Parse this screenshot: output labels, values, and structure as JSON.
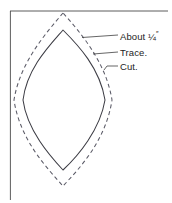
{
  "figure": {
    "name": "sewing-pattern-seam-allowance-diagram",
    "background_color": "#ffffff",
    "frame": {
      "top_rule_color": "#4a4a4a",
      "left_rule_color": "#4a4a4a"
    },
    "shapes": {
      "cut_line": {
        "label": "Cut.",
        "style": "dashed",
        "color": "#5a5a66",
        "dash_pattern": "4 3"
      },
      "trace_line": {
        "label": "Trace.",
        "style": "solid",
        "color": "#3c3c44"
      }
    },
    "labels": {
      "offset": {
        "prefix": "About ",
        "fraction": "¼",
        "unit": "″"
      },
      "trace": "Trace.",
      "cut": "Cut."
    },
    "leader_line_color": "#4a4a4a"
  }
}
